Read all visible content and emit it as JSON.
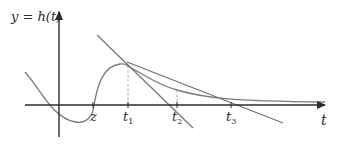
{
  "y_axis_label": "y = h(t)",
  "x_axis_label": "t",
  "points": [
    {
      "name": "z",
      "label": "z",
      "sub": ""
    },
    {
      "name": "t1",
      "label": "t",
      "sub": "1"
    },
    {
      "name": "t2",
      "label": "t",
      "sub": "2"
    },
    {
      "name": "t3",
      "label": "t",
      "sub": "3"
    }
  ],
  "colors": {
    "axis": "#2b2b2b",
    "curve": "#7a7a7a",
    "tangent": "#6e6e6e",
    "dashed": "#a8a8a8",
    "text": "#2a2a2a"
  }
}
